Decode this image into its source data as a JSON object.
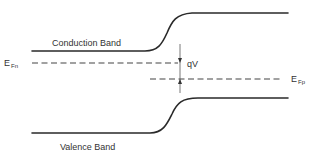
{
  "diagram": {
    "labels": {
      "conduction_band": "Conduction Band",
      "valence_band": "Valence Band",
      "fermi_n": {
        "main": "E",
        "sub": "Fn"
      },
      "fermi_p": {
        "main": "E",
        "sub": "Fp"
      },
      "bias": "qV"
    },
    "colors": {
      "line": "#2a2a2a",
      "text": "#333333",
      "background": "#ffffff"
    },
    "geometry": {
      "conduction_band": {
        "left_y": 51,
        "right_y": 13,
        "x_start": 32,
        "x_end": 288
      },
      "valence_band": {
        "left_y": 133,
        "right_y": 98,
        "x_start": 32,
        "x_end": 288
      },
      "fermi_n_level": {
        "y": 63,
        "x_start": 32,
        "x_end": 178
      },
      "fermi_p_level": {
        "y": 79,
        "x_start": 150,
        "x_end": 282
      },
      "qv_arrow_x": 180
    }
  }
}
